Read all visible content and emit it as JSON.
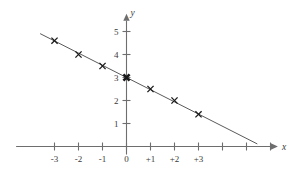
{
  "chart_data": {
    "type": "scatter",
    "title": "",
    "subtitle": "",
    "xlabel": "x",
    "ylabel": "y",
    "x": [
      -3,
      -2,
      -1,
      0,
      1,
      2,
      3
    ],
    "values": [
      4.6,
      4.0,
      3.5,
      3.0,
      2.5,
      2.0,
      1.4
    ],
    "series": [
      {
        "name": "data points",
        "marker": "cross",
        "values": [
          4.6,
          4.0,
          3.5,
          3.0,
          2.5,
          2.0,
          1.4
        ]
      }
    ],
    "fit_line": {
      "type": "line",
      "slope": -0.53,
      "intercept": 3.0,
      "x_start": -3.6,
      "x_end": 5.45
    },
    "xlim": [
      -4.6,
      6.6
    ],
    "ylim": [
      -0.35,
      5.9
    ],
    "xticks": [
      -3,
      -2,
      -1,
      0,
      1,
      2,
      3,
      4,
      5,
      6
    ],
    "xtick_labels": [
      "-3",
      "-2",
      "-1",
      "0",
      "+1",
      "+2",
      "+3",
      "",
      "",
      ""
    ],
    "yticks": [
      1,
      2,
      3,
      4,
      5
    ],
    "ytick_labels": [
      "1",
      "2",
      "3",
      "4",
      "5"
    ],
    "grid": false,
    "legend": null,
    "legend_position": "none",
    "annotations": [],
    "colors": {
      "axis": "#6e6e6e",
      "line": "#5a5a5a",
      "marker": "#1a1a1a",
      "text": "#3a3a3a",
      "background": "#ffffff"
    }
  },
  "axis": {
    "x_label": "x",
    "y_label": "y"
  },
  "ticks": {
    "x": [
      {
        "value": -3,
        "label": "-3"
      },
      {
        "value": -2,
        "label": "-2"
      },
      {
        "value": -1,
        "label": "-1"
      },
      {
        "value": 0,
        "label": "0"
      },
      {
        "value": 1,
        "label": "+1"
      },
      {
        "value": 2,
        "label": "+2"
      },
      {
        "value": 3,
        "label": "+3"
      },
      {
        "value": 4,
        "label": ""
      },
      {
        "value": 5,
        "label": ""
      },
      {
        "value": 6,
        "label": ""
      }
    ],
    "y": [
      {
        "value": 1,
        "label": "1"
      },
      {
        "value": 2,
        "label": "2"
      },
      {
        "value": 3,
        "label": "3"
      },
      {
        "value": 4,
        "label": "4"
      },
      {
        "value": 5,
        "label": "5"
      }
    ]
  }
}
